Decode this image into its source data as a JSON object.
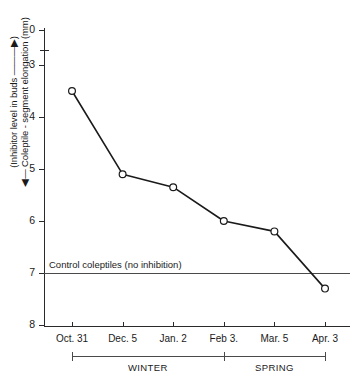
{
  "chart_data": {
    "type": "line",
    "title": "",
    "xlabel": "",
    "ylabel_line1": "(Inhibitor level in buds ———▶)",
    "ylabel_line2": "◀— Coleptile - segment elongation (mm)",
    "categories": [
      "Oct. 31",
      "Dec. 5",
      "Jan. 2",
      "Feb 3.",
      "Mar. 5",
      "Apr. 3"
    ],
    "values": [
      3.5,
      5.1,
      5.35,
      6.0,
      6.2,
      7.3
    ],
    "yticks": [
      0,
      3,
      4,
      5,
      6,
      7,
      8
    ],
    "ytick_labels": [
      "0",
      "3",
      "4",
      "5",
      "6",
      "7",
      "8"
    ],
    "ylim": [
      0,
      8
    ],
    "y_inverted": true,
    "y_axis_break": true,
    "y_axis_break_between": [
      0,
      3
    ],
    "grid": false,
    "legend": "none",
    "marker": "open-circle",
    "line_color": "#1a1a1a",
    "marker_fill": "#ffffff",
    "annotations": [
      {
        "name": "control-line",
        "label": "Control coleptiles (no inhibition)",
        "y_value": 7,
        "orientation": "horizontal"
      }
    ],
    "season_brackets": [
      {
        "label": "WINTER",
        "from": "Oct. 31",
        "to": "Feb 3."
      },
      {
        "label": "SPRING",
        "from": "Feb 3.",
        "to": "Apr. 3"
      }
    ]
  },
  "colors": {
    "ink": "#1a1a1a",
    "axis": "#2a2a2a",
    "rule": "#4a4a4a",
    "background": "#ffffff"
  }
}
